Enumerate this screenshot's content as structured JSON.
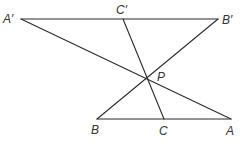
{
  "diagram": {
    "type": "geometry",
    "points": {
      "A_prime": {
        "label": "A′",
        "x": 21,
        "y": 19
      },
      "C_prime": {
        "label": "C′",
        "x": 123,
        "y": 19
      },
      "B_prime": {
        "label": "B′",
        "x": 218,
        "y": 19
      },
      "P": {
        "label": "P",
        "x": 145,
        "y": 80
      },
      "B": {
        "label": "B",
        "x": 97,
        "y": 119
      },
      "C": {
        "label": "C",
        "x": 164,
        "y": 119
      },
      "A": {
        "label": "A",
        "x": 231,
        "y": 119
      }
    },
    "segments": [
      [
        "A_prime",
        "B_prime"
      ],
      [
        "B",
        "A"
      ],
      [
        "A_prime",
        "A"
      ],
      [
        "B_prime",
        "B"
      ],
      [
        "C_prime",
        "C"
      ]
    ],
    "line_color": "#2b2b2b",
    "label_color": "#333333"
  }
}
